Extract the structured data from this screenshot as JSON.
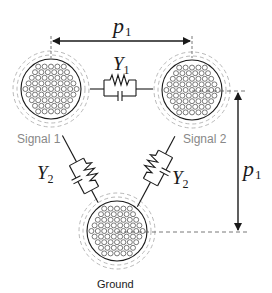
{
  "colors": {
    "line": "#1a1a1a",
    "strand": "#555555",
    "dashed_ring": "#b0b0b0",
    "label_gray": "#888888",
    "background": "#ffffff"
  },
  "conductors": [
    {
      "id": "signal1",
      "label": "Signal 1",
      "cx": 51,
      "cy": 89
    },
    {
      "id": "signal2",
      "label": "Signal 2",
      "cx": 192,
      "cy": 90
    },
    {
      "id": "ground",
      "label": "Ground",
      "cx": 117,
      "cy": 231
    }
  ],
  "admittances": {
    "y1": {
      "symbol": "Y",
      "subscript": "1"
    },
    "y2_left": {
      "symbol": "Y",
      "subscript": "2"
    },
    "y2_right": {
      "symbol": "Y",
      "subscript": "2"
    }
  },
  "dimensions": {
    "horizontal": {
      "symbol": "p",
      "subscript": "1"
    },
    "vertical": {
      "symbol": "p",
      "subscript": "1"
    }
  }
}
